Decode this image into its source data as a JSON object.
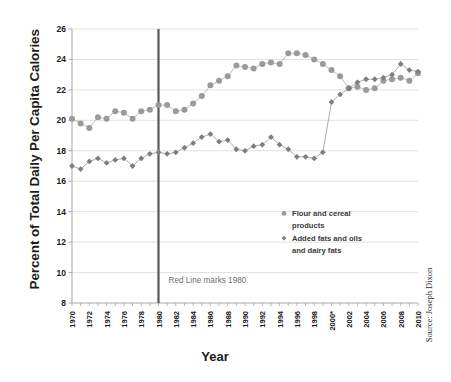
{
  "chart_data": {
    "type": "line",
    "title": "",
    "xlabel": "Year",
    "ylabel": "Percent of Total Daily Per Capita Calories",
    "xlim": [
      1970,
      2010
    ],
    "ylim": [
      8,
      26
    ],
    "ytick_step": 2,
    "yticks": [
      "8",
      "10",
      "12",
      "14",
      "16",
      "18",
      "20",
      "22",
      "24",
      "26"
    ],
    "xticks": [
      "1970",
      "1972",
      "1974",
      "1976",
      "1978",
      "1980",
      "1982",
      "1984",
      "1986",
      "1988",
      "1990",
      "1992",
      "1994",
      "1996",
      "1998",
      "2000*",
      "2002",
      "2004",
      "2006",
      "2008",
      "2010"
    ],
    "grid": "horizontal",
    "legend_position": "center-right",
    "x": [
      1970,
      1971,
      1972,
      1973,
      1974,
      1975,
      1976,
      1977,
      1978,
      1979,
      1980,
      1981,
      1982,
      1983,
      1984,
      1985,
      1986,
      1987,
      1988,
      1989,
      1990,
      1991,
      1992,
      1993,
      1994,
      1995,
      1996,
      1997,
      1998,
      1999,
      2000,
      2001,
      2002,
      2003,
      2004,
      2005,
      2006,
      2007,
      2008,
      2009,
      2010
    ],
    "series": [
      {
        "name": "Flour and cereal products",
        "marker": "circle",
        "color": "#9a9a9a",
        "values": [
          20.1,
          19.8,
          19.5,
          20.2,
          20.1,
          20.6,
          20.5,
          20.1,
          20.6,
          20.7,
          21.0,
          21.0,
          20.6,
          20.7,
          21.1,
          21.6,
          22.3,
          22.6,
          22.9,
          23.6,
          23.5,
          23.4,
          23.7,
          23.8,
          23.7,
          24.4,
          24.4,
          24.3,
          24.0,
          23.7,
          23.3,
          22.9,
          22.1,
          22.2,
          22.0,
          22.1,
          22.6,
          22.7,
          22.8,
          22.6,
          23.1
        ]
      },
      {
        "name": "Added fats and oils and dairy fats",
        "marker": "diamond",
        "color": "#7e7e7e",
        "values": [
          17.0,
          16.8,
          17.3,
          17.5,
          17.2,
          17.4,
          17.5,
          17.0,
          17.5,
          17.8,
          17.9,
          17.8,
          17.9,
          18.2,
          18.5,
          18.9,
          19.1,
          18.6,
          18.7,
          18.1,
          18.0,
          18.3,
          18.4,
          18.9,
          18.4,
          18.1,
          17.6,
          17.6,
          17.5,
          17.9,
          21.2,
          21.7,
          22.1,
          22.5,
          22.7,
          22.7,
          22.8,
          23.0,
          23.7,
          23.3,
          23.2
        ]
      }
    ],
    "annotations": [
      {
        "name": "red-line-1980",
        "text": "Red Line marks 1980",
        "x_value": 1980,
        "line_color": "#595959"
      }
    ],
    "source_note": "Source: Joseph Dixon"
  },
  "axes": {
    "y_title": "Percent of Total Daily Per Capita Calories",
    "x_title": "Year"
  },
  "legend": {
    "item1": "Flour and cereal",
    "item1b": "products",
    "item2": "Added fats and oils",
    "item2b": "and dairy fats"
  },
  "annotation": {
    "red_line_label": "Red Line marks 1980"
  },
  "source": {
    "text": "Source: Joseph Dixon"
  },
  "colors": {
    "series1": "#9a9a9a",
    "series2": "#7e7e7e",
    "grid": "#d9d9d9",
    "axis": "#a6a6a6",
    "vline": "#595959",
    "text": "#1a1a1a"
  }
}
